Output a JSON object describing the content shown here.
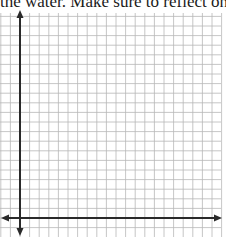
{
  "document": {
    "instruction_text": "the water. Make sure to reflect on the pr"
  },
  "graph_paper": {
    "grid_color": "#b8b8b8",
    "axis_color": "#2a2a2a",
    "grid_spacing_px": 9.6,
    "x_axis": {
      "has_left_arrow": true,
      "has_right_arrow": true
    },
    "y_axis": {
      "has_up_arrow": true,
      "has_down_arrow": true
    }
  }
}
